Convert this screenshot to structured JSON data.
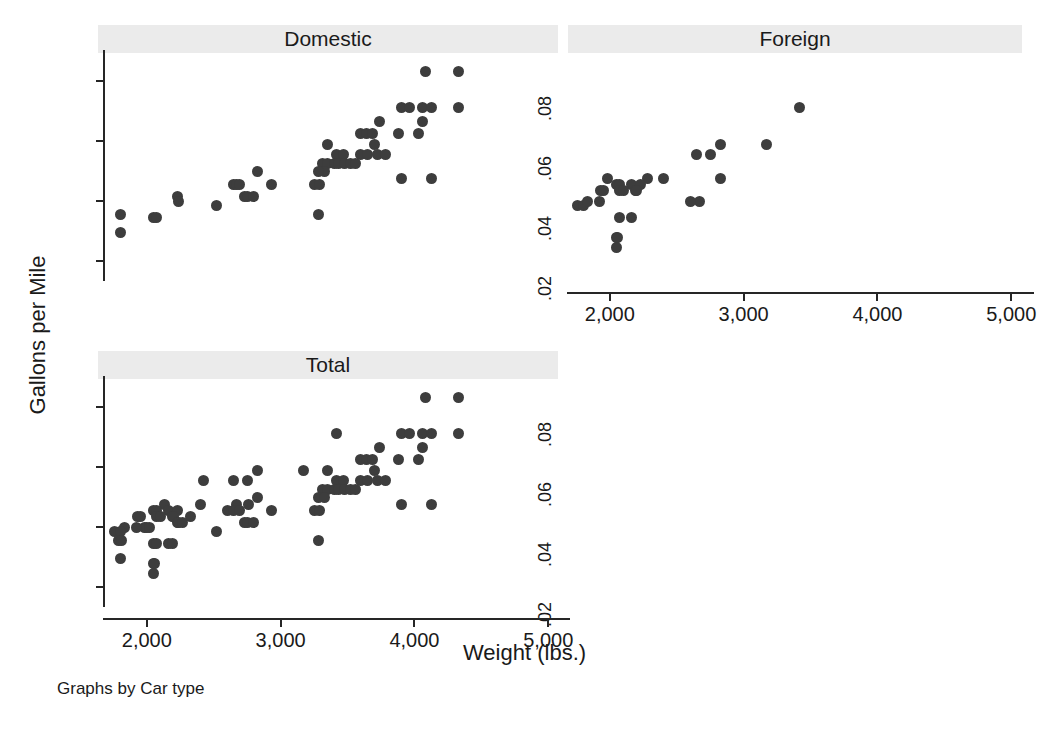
{
  "figure": {
    "ylabel": "Gallons per Mile",
    "xlabel": "Weight (lbs.)",
    "note": "Graphs by Car type",
    "marker_color": "#3d3d3d",
    "title_strip_color": "#ebebeb",
    "axis_color": "#262626",
    "background": "#ffffff"
  },
  "chart_data": {
    "type": "scatter",
    "title": "",
    "xlabel": "Weight (lbs.)",
    "ylabel": "Gallons per Mile",
    "xlim": [
      1680,
      5080
    ],
    "ylim": [
      0.018,
      0.0865
    ],
    "xticks": [
      2000,
      3000,
      4000,
      5000
    ],
    "xticklabels": [
      "2,000",
      "3,000",
      "4,000",
      "5,000"
    ],
    "yticks": [
      0.02,
      0.04,
      0.06,
      0.08
    ],
    "yticklabels": [
      ".02",
      ".04",
      ".06",
      ".08"
    ],
    "grid": false,
    "legend": "none",
    "facet_by": "Car type",
    "panels": [
      {
        "name": "Domestic",
        "label": "Domestic",
        "points": [
          [
            4080,
            0.0833
          ],
          [
            4330,
            0.0833
          ],
          [
            3900,
            0.0714
          ],
          [
            3960,
            0.0714
          ],
          [
            4060,
            0.0714
          ],
          [
            4130,
            0.0714
          ],
          [
            4330,
            0.0714
          ],
          [
            3740,
            0.0667
          ],
          [
            4060,
            0.0667
          ],
          [
            3600,
            0.0625
          ],
          [
            3640,
            0.0625
          ],
          [
            3690,
            0.0625
          ],
          [
            3880,
            0.0625
          ],
          [
            4030,
            0.0625
          ],
          [
            3700,
            0.0588
          ],
          [
            3350,
            0.0588
          ],
          [
            3420,
            0.0556
          ],
          [
            3470,
            0.0556
          ],
          [
            3600,
            0.0556
          ],
          [
            3650,
            0.0556
          ],
          [
            3720,
            0.0556
          ],
          [
            3780,
            0.0556
          ],
          [
            3310,
            0.0526
          ],
          [
            3350,
            0.0526
          ],
          [
            3400,
            0.0526
          ],
          [
            3430,
            0.0526
          ],
          [
            3480,
            0.0526
          ],
          [
            3520,
            0.0526
          ],
          [
            3560,
            0.0526
          ],
          [
            3330,
            0.05
          ],
          [
            2830,
            0.05
          ],
          [
            3280,
            0.05
          ],
          [
            3250,
            0.0455
          ],
          [
            3290,
            0.0455
          ],
          [
            2930,
            0.0455
          ],
          [
            2650,
            0.0455
          ],
          [
            2670,
            0.0455
          ],
          [
            2690,
            0.0455
          ],
          [
            3900,
            0.0476
          ],
          [
            4130,
            0.0476
          ],
          [
            2730,
            0.0417
          ],
          [
            2750,
            0.0417
          ],
          [
            2800,
            0.0417
          ],
          [
            2230,
            0.0417
          ],
          [
            2240,
            0.04
          ],
          [
            2520,
            0.0385
          ],
          [
            3280,
            0.0357
          ],
          [
            1800,
            0.0357
          ],
          [
            2050,
            0.0345
          ],
          [
            2070,
            0.0345
          ],
          [
            1800,
            0.0294
          ]
        ]
      },
      {
        "name": "Foreign",
        "label": "Foreign",
        "points": [
          [
            3420,
            0.0714
          ],
          [
            2650,
            0.0556
          ],
          [
            2750,
            0.0556
          ],
          [
            3170,
            0.0588
          ],
          [
            2830,
            0.0588
          ],
          [
            2830,
            0.0476
          ],
          [
            2280,
            0.0476
          ],
          [
            2400,
            0.0476
          ],
          [
            1980,
            0.0476
          ],
          [
            2050,
            0.0455
          ],
          [
            2070,
            0.0455
          ],
          [
            2160,
            0.0455
          ],
          [
            2230,
            0.0455
          ],
          [
            1930,
            0.0435
          ],
          [
            1950,
            0.0435
          ],
          [
            2070,
            0.0435
          ],
          [
            2100,
            0.0435
          ],
          [
            2190,
            0.0435
          ],
          [
            2200,
            0.0435
          ],
          [
            1760,
            0.0385
          ],
          [
            1800,
            0.0385
          ],
          [
            1830,
            0.04
          ],
          [
            1920,
            0.04
          ],
          [
            2670,
            0.04
          ],
          [
            2600,
            0.04
          ],
          [
            2070,
            0.0345
          ],
          [
            2160,
            0.0345
          ],
          [
            2050,
            0.0278
          ],
          [
            2060,
            0.0278
          ],
          [
            2050,
            0.0244
          ]
        ]
      },
      {
        "name": "Total",
        "label": "Total",
        "points": [
          [
            4080,
            0.0833
          ],
          [
            4330,
            0.0833
          ],
          [
            3420,
            0.0714
          ],
          [
            3900,
            0.0714
          ],
          [
            3960,
            0.0714
          ],
          [
            4060,
            0.0714
          ],
          [
            4130,
            0.0714
          ],
          [
            4330,
            0.0714
          ],
          [
            3740,
            0.0667
          ],
          [
            4060,
            0.0667
          ],
          [
            3600,
            0.0625
          ],
          [
            3640,
            0.0625
          ],
          [
            3690,
            0.0625
          ],
          [
            3880,
            0.0625
          ],
          [
            4030,
            0.0625
          ],
          [
            3700,
            0.0588
          ],
          [
            3170,
            0.0588
          ],
          [
            3350,
            0.0588
          ],
          [
            2830,
            0.0588
          ],
          [
            2420,
            0.0556
          ],
          [
            2650,
            0.0556
          ],
          [
            2750,
            0.0556
          ],
          [
            3420,
            0.0556
          ],
          [
            3470,
            0.0556
          ],
          [
            3600,
            0.0556
          ],
          [
            3650,
            0.0556
          ],
          [
            3720,
            0.0556
          ],
          [
            3780,
            0.0556
          ],
          [
            3310,
            0.0526
          ],
          [
            3350,
            0.0526
          ],
          [
            3400,
            0.0526
          ],
          [
            3430,
            0.0526
          ],
          [
            3480,
            0.0526
          ],
          [
            3520,
            0.0526
          ],
          [
            3560,
            0.0526
          ],
          [
            3280,
            0.05
          ],
          [
            3330,
            0.05
          ],
          [
            2830,
            0.05
          ],
          [
            2130,
            0.0476
          ],
          [
            2670,
            0.0476
          ],
          [
            2760,
            0.0476
          ],
          [
            2400,
            0.0476
          ],
          [
            3900,
            0.0476
          ],
          [
            4130,
            0.0476
          ],
          [
            2600,
            0.0455
          ],
          [
            2650,
            0.0455
          ],
          [
            2690,
            0.0455
          ],
          [
            2930,
            0.0455
          ],
          [
            3250,
            0.0455
          ],
          [
            3290,
            0.0455
          ],
          [
            2050,
            0.0455
          ],
          [
            2070,
            0.0455
          ],
          [
            2160,
            0.0455
          ],
          [
            2230,
            0.0455
          ],
          [
            1930,
            0.0435
          ],
          [
            1950,
            0.0435
          ],
          [
            2070,
            0.0435
          ],
          [
            2100,
            0.0435
          ],
          [
            2190,
            0.0435
          ],
          [
            2200,
            0.0435
          ],
          [
            2330,
            0.0435
          ],
          [
            2230,
            0.0417
          ],
          [
            2240,
            0.0417
          ],
          [
            2270,
            0.0417
          ],
          [
            2730,
            0.0417
          ],
          [
            2750,
            0.0417
          ],
          [
            2800,
            0.0417
          ],
          [
            1980,
            0.04
          ],
          [
            2000,
            0.04
          ],
          [
            2020,
            0.04
          ],
          [
            1830,
            0.04
          ],
          [
            1920,
            0.04
          ],
          [
            2520,
            0.0385
          ],
          [
            1760,
            0.0385
          ],
          [
            1800,
            0.0385
          ],
          [
            3280,
            0.0357
          ],
          [
            1790,
            0.0357
          ],
          [
            1810,
            0.0357
          ],
          [
            2050,
            0.0345
          ],
          [
            2070,
            0.0345
          ],
          [
            2160,
            0.0345
          ],
          [
            2190,
            0.0345
          ],
          [
            1800,
            0.0294
          ],
          [
            2050,
            0.0278
          ],
          [
            2060,
            0.0278
          ],
          [
            2050,
            0.0244
          ]
        ]
      }
    ]
  }
}
